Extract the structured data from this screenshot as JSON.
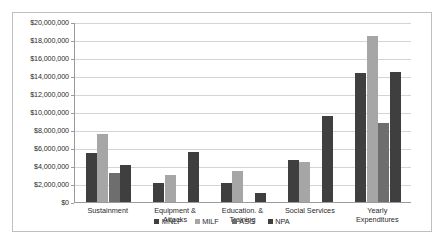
{
  "chart_data": {
    "type": "bar",
    "title": "",
    "subtitle": "",
    "xlabel": "",
    "ylabel": "",
    "ylim": [
      0,
      20000000
    ],
    "ytick_step": 2000000,
    "grid": true,
    "legend_position": "bottom",
    "categories": [
      "Sustainment",
      "Equipment &\nAttacks",
      "Education. &\nTraining",
      "Social Services",
      "Yearly\nExpenditures"
    ],
    "ytick_labels": [
      "$20,000,000",
      "$18,000,000",
      "$16,000,000",
      "$14,000,000",
      "$12,000,000",
      "$10,000,000",
      "$8,000,000",
      "$6,000,000",
      "$4,000,000",
      "$2,000,000",
      "$0"
    ],
    "series": [
      {
        "name": "MNLF",
        "color": "#3f3f3f",
        "values": [
          5500000,
          2100000,
          2100000,
          4700000,
          14300000
        ]
      },
      {
        "name": "MILF",
        "color": "#a6a6a6",
        "values": [
          7600000,
          3000000,
          3400000,
          4500000,
          18400000
        ]
      },
      {
        "name": "ASG",
        "color": "#6e6e6e",
        "values": [
          3200000,
          0,
          0,
          0,
          8800000
        ]
      },
      {
        "name": "NPA",
        "color": "#3f3f3f",
        "values": [
          4100000,
          5600000,
          1000000,
          9600000,
          14500000
        ]
      }
    ]
  },
  "legend": {
    "items": [
      {
        "label": "MNLF",
        "color": "#3f3f3f"
      },
      {
        "label": "MILF",
        "color": "#a6a6a6"
      },
      {
        "label": "ASG",
        "color": "#6e6e6e"
      },
      {
        "label": "NPA",
        "color": "#3f3f3f"
      }
    ]
  }
}
